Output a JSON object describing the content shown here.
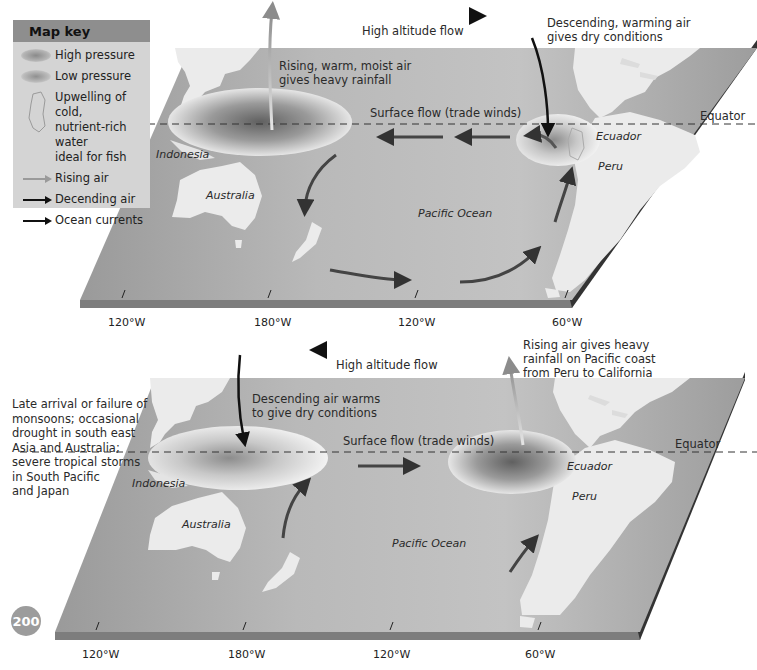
{
  "map_key": {
    "title": "Map key",
    "items": [
      {
        "symbol": "high-pressure-oval",
        "label": "High pressure"
      },
      {
        "symbol": "low-pressure-oval",
        "label": "Low pressure"
      },
      {
        "symbol": "upwelling-outline",
        "label_lines": [
          "Upwelling of cold,",
          "nutrient-rich water",
          "ideal for fish"
        ]
      },
      {
        "symbol": "grey-arrow",
        "label": "Rising air"
      },
      {
        "symbol": "black-arrow",
        "label": "Decending air"
      },
      {
        "symbol": "black-arrow",
        "label": "Ocean currents"
      }
    ]
  },
  "top_panel": {
    "high_altitude_flow": "High altitude flow",
    "rising_air_lines": [
      "Rising, warm, moist air",
      "gives heavy rainfall"
    ],
    "descending_air_lines": [
      "Descending, warming air",
      "gives dry conditions"
    ],
    "surface_flow": "Surface flow (trade winds)",
    "equator": "Equator",
    "places": {
      "indonesia": "Indonesia",
      "australia": "Australia",
      "pacific": "Pacific Ocean",
      "ecuador": "Ecuador",
      "peru": "Peru"
    },
    "longitudes": [
      "120°W",
      "180°W",
      "120°W",
      "60°W"
    ]
  },
  "bottom_panel": {
    "high_altitude_flow": "High altitude flow",
    "rising_air_lines": [
      "Rising air gives heavy",
      "rainfall on Pacific coast",
      "from Peru to California"
    ],
    "descending_air_lines": [
      "Descending air warms",
      "to give dry conditions"
    ],
    "surface_flow": "Surface flow (trade winds)",
    "equator": "Equator",
    "side_note_lines": [
      "Late arrival or failure of",
      "monsoons; occasional",
      "drought in south east",
      "Asia and Australia;",
      "severe tropical storms",
      "in South Pacific",
      "and Japan"
    ],
    "places": {
      "indonesia": "Indonesia",
      "australia": "Australia",
      "pacific": "Pacific Ocean",
      "ecuador": "Ecuador",
      "peru": "Peru"
    },
    "longitudes": [
      "120°W",
      "180°W",
      "120°W",
      "60°W"
    ]
  },
  "page_number": "200",
  "colors": {
    "ocean": "#a9a9a9",
    "ocean_light": "#c4c4c4",
    "land": "#ebebeb",
    "edge": "#7a7a7a",
    "key_bg": "#d4d4d4",
    "key_header": "#8e8e8e"
  }
}
